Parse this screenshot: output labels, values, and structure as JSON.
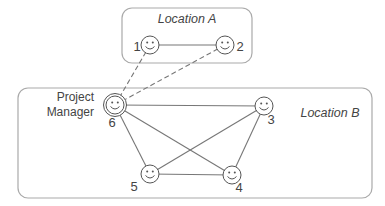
{
  "colors": {
    "line": "#777777",
    "box_stroke": "#aaaaaa",
    "text": "#444444",
    "face": "#555555"
  },
  "locations": [
    {
      "id": "A",
      "label": "Location A",
      "x": 122,
      "y": 8,
      "w": 130,
      "h": 55,
      "label_x": 187,
      "label_y": 23
    },
    {
      "id": "B",
      "label": "Location B",
      "x": 18,
      "y": 88,
      "w": 354,
      "h": 110,
      "label_x": 330,
      "label_y": 117
    }
  ],
  "nodes": [
    {
      "id": "1",
      "label": "1",
      "x": 150,
      "y": 45,
      "lx": 137,
      "ly": 51,
      "double": false
    },
    {
      "id": "2",
      "label": "2",
      "x": 225,
      "y": 45,
      "lx": 240,
      "ly": 51,
      "double": false
    },
    {
      "id": "3",
      "label": "3",
      "x": 264,
      "y": 106,
      "lx": 271,
      "ly": 124,
      "double": false
    },
    {
      "id": "4",
      "label": "4",
      "x": 232,
      "y": 175,
      "lx": 239,
      "ly": 192,
      "double": false
    },
    {
      "id": "5",
      "label": "5",
      "x": 150,
      "y": 174,
      "lx": 134,
      "ly": 191,
      "double": false
    },
    {
      "id": "6",
      "label": "6",
      "x": 115,
      "y": 105,
      "lx": 112,
      "ly": 127,
      "double": true
    }
  ],
  "role_label": {
    "lines": [
      "Project",
      "Manager"
    ],
    "x": 94,
    "y": 105
  },
  "edges": [
    {
      "from": "1",
      "to": "2",
      "dashed": false
    },
    {
      "from": "1",
      "to": "6",
      "dashed": true
    },
    {
      "from": "2",
      "to": "6",
      "dashed": true
    },
    {
      "from": "6",
      "to": "3",
      "dashed": false
    },
    {
      "from": "6",
      "to": "5",
      "dashed": false
    },
    {
      "from": "6",
      "to": "4",
      "dashed": false
    },
    {
      "from": "5",
      "to": "3",
      "dashed": false
    },
    {
      "from": "5",
      "to": "4",
      "dashed": false
    },
    {
      "from": "3",
      "to": "4",
      "dashed": false
    }
  ]
}
